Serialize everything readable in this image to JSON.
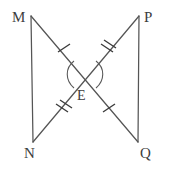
{
  "figure": {
    "background_color": "#ffffff",
    "line_color": "#555555",
    "label_color": "#3d3d3d",
    "labels": {
      "M": "M",
      "P": "P",
      "N": "N",
      "Q": "Q",
      "E": "E"
    },
    "points": {
      "M": {
        "x": 31,
        "y": 16
      },
      "P": {
        "x": 139,
        "y": 16
      },
      "N": {
        "x": 33,
        "y": 142
      },
      "Q": {
        "x": 138,
        "y": 142
      },
      "E": {
        "x": 85,
        "y": 80
      }
    },
    "segments": [
      {
        "name": "MN",
        "from": "M",
        "to": "N"
      },
      {
        "name": "PQ",
        "from": "P",
        "to": "Q"
      },
      {
        "name": "MQ",
        "from": "M",
        "to": "Q"
      },
      {
        "name": "PN",
        "from": "P",
        "to": "N"
      }
    ],
    "congruence_marks": [
      {
        "segment": "ME",
        "ticks": 1
      },
      {
        "segment": "PE",
        "ticks": 2
      },
      {
        "segment": "EN",
        "ticks": 2
      },
      {
        "segment": "EQ",
        "ticks": 1
      }
    ],
    "angle_marks": [
      {
        "name": "angle-MEP",
        "arcs": 1,
        "side": "left"
      },
      {
        "name": "angle-NEQ",
        "arcs": 1,
        "side": "right"
      }
    ]
  }
}
